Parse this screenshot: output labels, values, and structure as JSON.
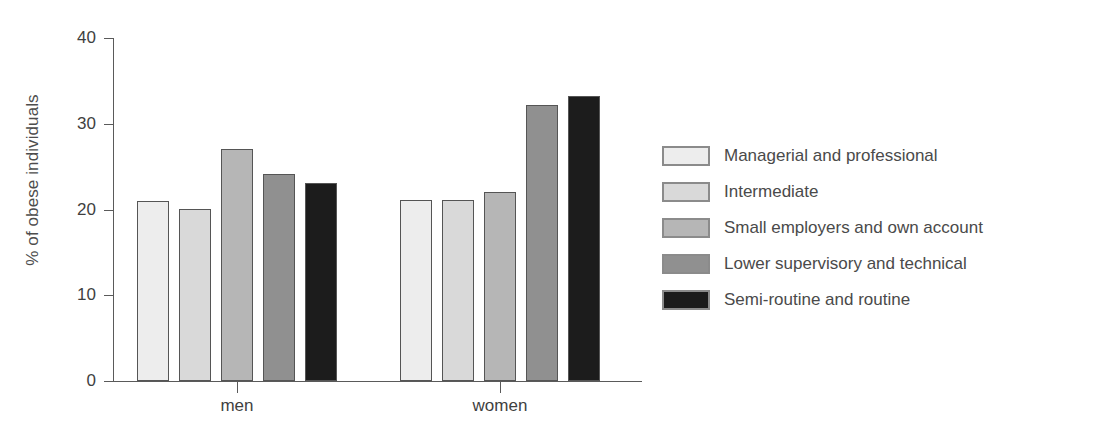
{
  "chart_data": {
    "type": "bar",
    "title": "",
    "subtitle": "",
    "xlabel": "",
    "ylabel": "% of obese individuals",
    "categories": [
      "men",
      "women"
    ],
    "ylim": [
      0,
      40
    ],
    "yticks": [
      0,
      10,
      20,
      30,
      40
    ],
    "ytick_labels": [
      "0",
      "10",
      "20",
      "30",
      "40"
    ],
    "grid": false,
    "legend_position": "right",
    "series": [
      {
        "name": "Managerial and professional",
        "color": "#ededed",
        "values": [
          21.0,
          21.1
        ]
      },
      {
        "name": "Intermediate",
        "color": "#d9d9d9",
        "values": [
          20.1,
          21.1
        ]
      },
      {
        "name": "Small employers and own account",
        "color": "#b6b6b6",
        "values": [
          27.0,
          22.1
        ]
      },
      {
        "name": "Lower supervisory and technical",
        "color": "#909090",
        "values": [
          24.1,
          32.2
        ]
      },
      {
        "name": "Semi-routine and routine",
        "color": "#1c1c1c",
        "values": [
          23.1,
          33.2
        ]
      }
    ]
  },
  "legend": {
    "items": [
      "Managerial and professional",
      "Intermediate",
      "Small employers and own account",
      "Lower supervisory and technical",
      "Semi-routine and routine"
    ]
  },
  "colors": {
    "axis": "#5a5a5a",
    "tick_text": "#3f3f3f",
    "legend_text": "#4a4a4a",
    "background": "#ffffff",
    "bar_border": "#555555"
  }
}
